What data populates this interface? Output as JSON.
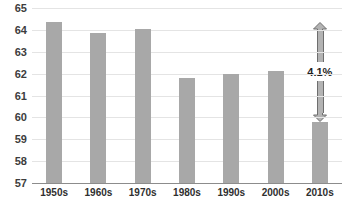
{
  "chart_data": {
    "type": "bar",
    "title": "",
    "subtitle": "",
    "xlabel": "",
    "ylabel": "",
    "categories": [
      "1950s",
      "1960s",
      "1970s",
      "1980s",
      "1990s",
      "2000s",
      "2010s"
    ],
    "values": [
      64.35,
      63.88,
      64.05,
      61.78,
      61.97,
      62.13,
      59.77
    ],
    "series": [
      {
        "name": "",
        "values": [
          64.35,
          63.88,
          64.05,
          61.78,
          61.97,
          62.13,
          59.77
        ]
      }
    ],
    "ylim": [
      57,
      65
    ],
    "yticks": [
      57,
      58,
      59,
      60,
      61,
      62,
      63,
      64,
      65
    ],
    "ytick_labels": [
      "57",
      "58",
      "59",
      "60",
      "61",
      "62",
      "63",
      "64",
      "65"
    ],
    "xtick_labels": [
      "1950s",
      "1960s",
      "1970s",
      "1980s",
      "1990s",
      "2000s",
      "2010s"
    ],
    "grid": true,
    "legend": false,
    "legend_position": "none",
    "bar_color": "#a8a8a8",
    "gridline_color": "#e4e4e4",
    "axis_color": "#8c8c8c",
    "text_color": "#3d3d3d",
    "annotations": [
      {
        "label": "4.1%",
        "type": "double-headed-arrow",
        "from_value": 64.35,
        "to_value": 59.77,
        "at_category": "2010s",
        "color": "#8a8a8a"
      }
    ]
  }
}
